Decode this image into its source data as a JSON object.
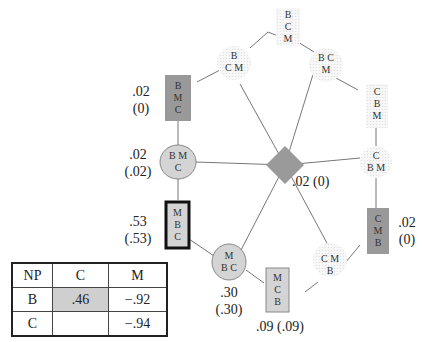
{
  "colors": {
    "line": "#777777",
    "dark_box": "#999999",
    "light_box": "#d4d4d4",
    "diamond": "#9a9a9a",
    "dotted_node": "#f1f1f1",
    "table_highlight": "#cfcfcf"
  },
  "nodes": [
    {
      "id": "top",
      "type": "dotted",
      "lines": [
        "B",
        "C",
        "M"
      ]
    },
    {
      "id": "upper-left-dotted",
      "type": "dotted",
      "lines": [
        "B",
        "C M"
      ]
    },
    {
      "id": "upper-right-dotted",
      "type": "dotted",
      "lines": [
        "B C",
        "M"
      ]
    },
    {
      "id": "right-top",
      "type": "dotted",
      "lines": [
        "C",
        "B",
        "M"
      ]
    },
    {
      "id": "right-mid",
      "type": "dotted",
      "lines": [
        "C",
        "B M"
      ]
    },
    {
      "id": "right-dark-box",
      "type": "dark-box",
      "lines": [
        "C",
        "M",
        "B"
      ],
      "prob": ".02",
      "prob_paren": "(0)"
    },
    {
      "id": "lower-right-dotted",
      "type": "dotted",
      "lines": [
        "C M",
        "B"
      ]
    },
    {
      "id": "bottom-light-box",
      "type": "light-box",
      "lines": [
        "M",
        "C",
        "B"
      ],
      "prob": ".09 (.09)"
    },
    {
      "id": "bottom-circle",
      "type": "circle",
      "lines": [
        "M",
        "B C"
      ],
      "prob": ".30",
      "prob_paren": "(.30)"
    },
    {
      "id": "left-bold-box",
      "type": "bold-box",
      "lines": [
        "M",
        "B",
        "C"
      ],
      "prob": ".53",
      "prob_paren": "(.53)"
    },
    {
      "id": "left-circle",
      "type": "circle",
      "lines": [
        "B M",
        "C"
      ],
      "prob": ".02",
      "prob_paren": "(.02)"
    },
    {
      "id": "left-dark-box",
      "type": "dark-box",
      "lines": [
        "B",
        "M",
        "C"
      ],
      "prob": ".02",
      "prob_paren": "(0)"
    },
    {
      "id": "center-diamond",
      "type": "diamond",
      "prob": ".02 (0)"
    }
  ],
  "table": {
    "headers": [
      "NP",
      "C",
      "M"
    ],
    "rows": [
      [
        "B",
        ".46",
        "−.92"
      ],
      [
        "C",
        "",
        "−.94"
      ]
    ]
  }
}
